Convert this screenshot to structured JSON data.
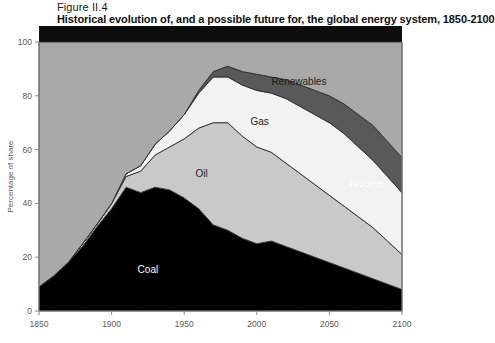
{
  "figure": {
    "number": "Figure II.4",
    "title": "Historical evolution of, and a possible future for, the global energy system, 1850-2100"
  },
  "chart_data": {
    "type": "area",
    "title": "Historical evolution of, and a possible future for, the global energy system, 1850-2100",
    "subtitle": "Figure II.4",
    "xlabel": "",
    "ylabel": "Percentage of share",
    "xlim": [
      1850,
      2100
    ],
    "ylim": [
      0,
      100
    ],
    "xticks": [
      1850,
      1900,
      1950,
      2000,
      2050,
      2100
    ],
    "yticks": [
      0,
      20,
      40,
      60,
      80,
      100
    ],
    "grid": false,
    "legend": "inline-labels",
    "stacked": true,
    "x": [
      1850,
      1860,
      1870,
      1880,
      1890,
      1900,
      1910,
      1920,
      1930,
      1940,
      1950,
      1960,
      1970,
      1980,
      1990,
      2000,
      2010,
      2020,
      2030,
      2040,
      2050,
      2060,
      2070,
      2080,
      2090,
      2100
    ],
    "series": [
      {
        "name": "Coal",
        "color": "#000000",
        "label_color": "#ffffff",
        "values": [
          9,
          13,
          18,
          24,
          31,
          38,
          46,
          44,
          46,
          45,
          42,
          38,
          32,
          30,
          27,
          25,
          26,
          24,
          22,
          20,
          18,
          16,
          14,
          12,
          10,
          8
        ]
      },
      {
        "name": "Oil",
        "color": "#c9c9c9",
        "label_color": "#1a1a1a",
        "values": [
          0,
          0,
          0,
          1,
          1,
          2,
          4,
          8,
          12,
          16,
          22,
          30,
          38,
          40,
          38,
          36,
          33,
          31,
          29,
          27,
          25,
          23,
          21,
          19,
          16,
          13
        ]
      },
      {
        "name": "Gas",
        "color": "#f2f2f2",
        "label_color": "#1a1a1a",
        "values": [
          0,
          0,
          0,
          0,
          0,
          0,
          1,
          2,
          4,
          6,
          9,
          13,
          17,
          17,
          19,
          21,
          22,
          24,
          25,
          26,
          27,
          27,
          26,
          25,
          24,
          23
        ]
      },
      {
        "name": "Nuclear",
        "color": "#595959",
        "label_color": "#ffffff",
        "values": [
          0,
          0,
          0,
          0,
          0,
          0,
          0,
          0,
          0,
          0,
          0,
          1,
          2,
          4,
          5,
          6,
          6,
          7,
          8,
          9,
          10,
          11,
          12,
          13,
          13,
          13
        ]
      },
      {
        "name": "Renewables",
        "color": "#a9a9a9",
        "label_color": "#1a1a1a",
        "values": [
          91,
          87,
          82,
          75,
          67,
          60,
          49,
          46,
          38,
          33,
          27,
          18,
          11,
          9,
          11,
          12,
          13,
          14,
          16,
          18,
          20,
          23,
          27,
          31,
          37,
          43
        ]
      }
    ],
    "annotations": [
      {
        "text": "Coal",
        "x": 1925,
        "y": 14
      },
      {
        "text": "Oil",
        "x": 1962,
        "y": 50
      },
      {
        "text": "Gas",
        "x": 2002,
        "y": 69
      },
      {
        "text": "Nuclear",
        "x": 2088,
        "y": 46
      },
      {
        "text": "Renewables",
        "x": 2029,
        "y": 84
      }
    ]
  }
}
